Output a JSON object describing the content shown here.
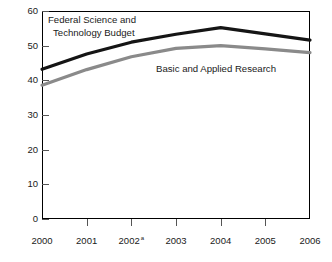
{
  "chart_data": {
    "type": "line",
    "title": "",
    "xlabel": "",
    "ylabel": "",
    "x": [
      "2000",
      "2001",
      "2002",
      "2003",
      "2004",
      "2005",
      "2006"
    ],
    "xtick_labels": [
      "2000",
      "2001",
      "2002",
      "2003",
      "2004",
      "2005",
      "2006"
    ],
    "xtick_footnote_index": 2,
    "xtick_footnote_marker": "a",
    "ylim": [
      0,
      60
    ],
    "ytick_labels": [
      "0",
      "10",
      "20",
      "30",
      "40",
      "50",
      "60"
    ],
    "ytick_values": [
      0,
      10,
      20,
      30,
      40,
      50,
      60
    ],
    "grid": false,
    "legend": "inline-annotations",
    "series": [
      {
        "name": "Federal Science and Technology Budget",
        "label_line1": "Federal Science and",
        "label_line2": "Technology Budget",
        "color": "#151515",
        "values": [
          43.2,
          47.6,
          51.0,
          53.3,
          55.2,
          53.4,
          51.6
        ]
      },
      {
        "name": "Basic and Applied Research",
        "label_line1": "Basic and Applied Research",
        "label_line2": "",
        "color": "#8a8a8a",
        "values": [
          38.6,
          43.1,
          46.8,
          49.2,
          50.0,
          49.1,
          48.0
        ]
      }
    ]
  },
  "axis": {
    "frame_color": "#000000",
    "tick_color": "#555555"
  }
}
